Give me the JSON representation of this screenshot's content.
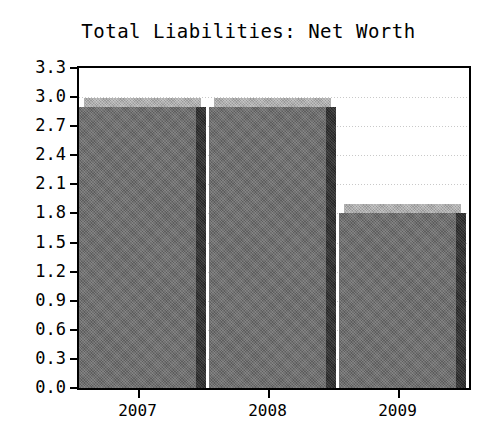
{
  "chart_data": {
    "type": "bar",
    "title": "Total Liabilities: Net Worth",
    "xlabel": "",
    "ylabel": "",
    "categories": [
      "2007",
      "2008",
      "2009"
    ],
    "values": [
      2.9,
      2.9,
      1.8
    ],
    "series": [
      {
        "name": "Total Liabilities: Net Worth",
        "values": [
          2.9,
          2.9,
          1.8
        ]
      }
    ],
    "ylim": [
      0.0,
      3.3
    ],
    "ytick_step": 0.3,
    "ytick_labels": [
      "3.3",
      "3.0",
      "2.7",
      "2.4",
      "2.1",
      "1.8",
      "1.5",
      "1.2",
      "0.9",
      "0.6",
      "0.3",
      "0.0"
    ],
    "ytick_values": [
      3.3,
      3.0,
      2.7,
      2.4,
      2.1,
      1.8,
      1.5,
      1.2,
      0.9,
      0.6,
      0.3,
      0.0
    ],
    "xtick_labels": [
      "2007",
      "2008",
      "2009"
    ],
    "grid": true,
    "legend": false,
    "style": "3d-bar",
    "colors": {
      "bar_front": "#6f6f6f",
      "bar_top": "#aeaeae",
      "bar_side": "#323232",
      "grid": "#c9c9c9",
      "axis": "#000000",
      "background": "#ffffff",
      "text": "#000000"
    }
  }
}
